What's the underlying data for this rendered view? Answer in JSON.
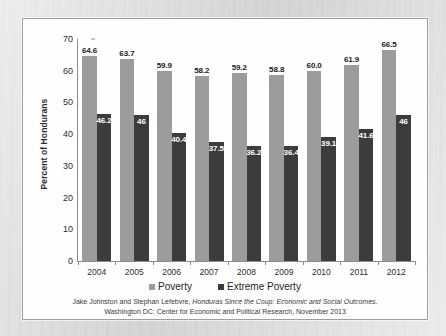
{
  "chart_data": {
    "type": "bar",
    "title": "",
    "subtitle": "",
    "xlabel": "",
    "ylabel": "Percent of Hondurans",
    "ylim": [
      0,
      70
    ],
    "ytick_step": 10,
    "yticks": [
      0,
      10,
      20,
      30,
      40,
      50,
      60,
      70
    ],
    "grid": false,
    "legend_position": "bottom",
    "categories": [
      "2004",
      "2005",
      "2006",
      "2007",
      "2008",
      "2009",
      "2010",
      "2011",
      "2012"
    ],
    "series": [
      {
        "name": "Poverty",
        "color": "#9c9c9c",
        "values": [
          64.6,
          63.7,
          59.9,
          58.2,
          59.2,
          58.8,
          60.0,
          61.9,
          66.5
        ],
        "labels": [
          "64.6",
          "63.7",
          "59.9",
          "58.2",
          "59.2",
          "58.8",
          "60.0",
          "61.9",
          "66.5"
        ]
      },
      {
        "name": "Extreme Poverty",
        "color": "#3c3c3c",
        "values": [
          46.2,
          46,
          40.4,
          37.5,
          36.2,
          36.4,
          39.1,
          41.6,
          46
        ],
        "labels": [
          "46.2",
          "46",
          "40.4",
          "37.5",
          "36.2",
          "36.4",
          "39.1",
          "41.6",
          "46"
        ]
      }
    ]
  },
  "legend": {
    "items": [
      {
        "label": "Poverty",
        "color": "#9c9c9c"
      },
      {
        "label": "Extreme Poverty",
        "color": "#3c3c3c"
      }
    ]
  },
  "source_note": {
    "line1_a": "Jake Johnston and Stephan Lefebvre, ",
    "line1_b": "Honduras Since the Coup: Economic and Social Outcomes",
    "line1_c": ".",
    "line2": "Washington DC: Center for Economic and Political Research, November 2013"
  }
}
